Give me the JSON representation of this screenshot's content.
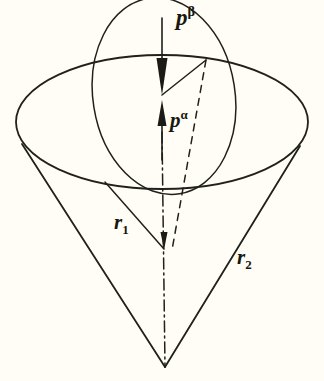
{
  "figure": {
    "domain": "Diagram",
    "background_color": "#fffdf6",
    "stroke_color": "#20201c",
    "width": 324,
    "height": 381
  },
  "labels": {
    "p_beta": {
      "base": "p",
      "superscript": "β",
      "name": "p-beta"
    },
    "p_alpha": {
      "base": "p",
      "superscript": "α",
      "name": "p-alpha"
    },
    "r1": {
      "base": "r",
      "subscript": "1",
      "name": "r-one"
    },
    "r2": {
      "base": "r",
      "subscript": "2",
      "name": "r-two"
    }
  },
  "geometry": {
    "outer_cone": {
      "apex": [
        165,
        367
      ],
      "rim_center": [
        162,
        122
      ],
      "rim_rx": 146,
      "rim_ry": 67
    },
    "inner_cone": {
      "apex": [
        164,
        248
      ],
      "rim_center": [
        162,
        93
      ],
      "rim_rx": 72,
      "rim_ry": 98,
      "tilt_deg": -8
    },
    "axis": {
      "from": [
        162,
        93
      ],
      "to": [
        165,
        367
      ],
      "style": "dash-dot"
    },
    "dashed_generator": {
      "from": [
        206,
        60
      ],
      "to": [
        171,
        250
      ],
      "style": "dashed"
    },
    "vector_p_beta": {
      "from": [
        162,
        18
      ],
      "to": [
        162,
        93
      ],
      "direction": "down",
      "arrowhead": true
    },
    "vector_p_alpha": {
      "from": [
        162,
        160
      ],
      "to": [
        162,
        100
      ],
      "direction": "up",
      "arrowhead": true
    }
  }
}
